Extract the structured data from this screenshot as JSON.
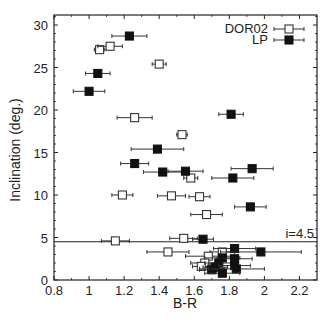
{
  "chart_data": {
    "type": "scatter",
    "title": "",
    "xlabel": "B-R",
    "ylabel": "Inclination (deg.)",
    "xlim": [
      0.8,
      2.3
    ],
    "ylim": [
      0,
      31
    ],
    "xticks": [
      0.8,
      1,
      1.2,
      1.4,
      1.6,
      1.8,
      2,
      2.2
    ],
    "xtick_labels": [
      "0.8",
      "1",
      "1.2",
      "1.4",
      "1.6",
      "1.8",
      "2",
      "2.2"
    ],
    "yticks": [
      0,
      5,
      10,
      15,
      20,
      25,
      30
    ],
    "ytick_labels": [
      "0",
      "5",
      "10",
      "15",
      "20",
      "25",
      "30"
    ],
    "grid": false,
    "legend_position": "upper right",
    "annotations": [
      {
        "type": "hline",
        "y": 4.5,
        "label": "i=4.5"
      }
    ],
    "series": [
      {
        "name": "DOR02",
        "marker": "open-square",
        "points": [
          {
            "x": 1.06,
            "y": 27.1,
            "xerr": 0.03
          },
          {
            "x": 1.12,
            "y": 27.5,
            "xerr": 0.07
          },
          {
            "x": 1.4,
            "y": 25.4,
            "xerr": 0.04
          },
          {
            "x": 1.26,
            "y": 19.1,
            "xerr": 0.1
          },
          {
            "x": 1.53,
            "y": 17.1,
            "xerr": 0.03
          },
          {
            "x": 1.58,
            "y": 12.0,
            "xerr": 0.04
          },
          {
            "x": 1.19,
            "y": 10.0,
            "xerr": 0.06
          },
          {
            "x": 1.47,
            "y": 9.9,
            "xerr": 0.08
          },
          {
            "x": 1.63,
            "y": 9.8,
            "xerr": 0.06
          },
          {
            "x": 1.67,
            "y": 7.7,
            "xerr": 0.09
          },
          {
            "x": 1.15,
            "y": 4.6,
            "xerr": 0.08
          },
          {
            "x": 1.54,
            "y": 4.9,
            "xerr": 0.08
          },
          {
            "x": 1.45,
            "y": 3.3,
            "xerr": 0.12
          },
          {
            "x": 1.76,
            "y": 3.3,
            "xerr": 0.07
          },
          {
            "x": 1.68,
            "y": 2.8,
            "xerr": 0.13
          },
          {
            "x": 1.66,
            "y": 2.0,
            "xerr": 0.08
          },
          {
            "x": 1.64,
            "y": 1.6,
            "xerr": 0.05
          },
          {
            "x": 1.7,
            "y": 1.3,
            "xerr": 0.07
          }
        ]
      },
      {
        "name": "LP",
        "marker": "filled-square",
        "points": [
          {
            "x": 1.23,
            "y": 28.7,
            "xerr": 0.1
          },
          {
            "x": 1.05,
            "y": 24.3,
            "xerr": 0.07
          },
          {
            "x": 1.0,
            "y": 22.2,
            "xerr": 0.09
          },
          {
            "x": 1.81,
            "y": 19.5,
            "xerr": 0.07
          },
          {
            "x": 1.39,
            "y": 15.4,
            "xerr": 0.15
          },
          {
            "x": 1.26,
            "y": 13.7,
            "xerr": 0.08
          },
          {
            "x": 1.42,
            "y": 12.7,
            "xerr": 0.11
          },
          {
            "x": 1.55,
            "y": 12.8,
            "xerr": 0.1
          },
          {
            "x": 1.93,
            "y": 13.1,
            "xerr": 0.12
          },
          {
            "x": 1.82,
            "y": 12.0,
            "xerr": 0.12
          },
          {
            "x": 1.92,
            "y": 8.6,
            "xerr": 0.09
          },
          {
            "x": 1.65,
            "y": 4.8,
            "xerr": 0.06
          },
          {
            "x": 1.83,
            "y": 3.7,
            "xerr": 0.12
          },
          {
            "x": 1.98,
            "y": 3.3,
            "xerr": 0.23
          },
          {
            "x": 1.76,
            "y": 2.6,
            "xerr": 0.1
          },
          {
            "x": 1.83,
            "y": 2.5,
            "xerr": 0.1
          },
          {
            "x": 1.74,
            "y": 2.0,
            "xerr": 0.08
          },
          {
            "x": 1.72,
            "y": 1.5,
            "xerr": 0.07
          },
          {
            "x": 1.83,
            "y": 1.7,
            "xerr": 0.09
          },
          {
            "x": 1.7,
            "y": 1.2,
            "xerr": 0.07
          },
          {
            "x": 1.84,
            "y": 1.3,
            "xerr": 0.16
          },
          {
            "x": 1.76,
            "y": 0.8,
            "xerr": 0.1
          }
        ]
      }
    ]
  },
  "legend": {
    "items": [
      {
        "label": "DOR02",
        "marker": "open-square"
      },
      {
        "label": "LP",
        "marker": "filled-square"
      }
    ]
  },
  "colors": {
    "axis": "#222222",
    "marker_fill": "#111111",
    "marker_open_fill": "#ffffff",
    "errorbar": "#333333"
  }
}
